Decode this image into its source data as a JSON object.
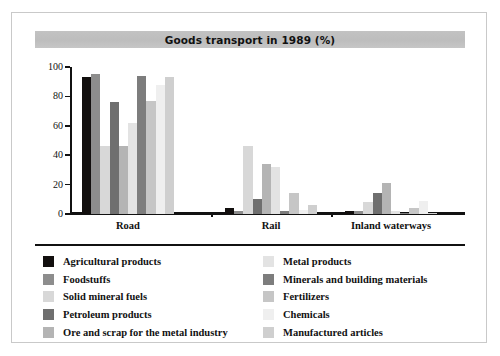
{
  "frame": {
    "present": true
  },
  "title": {
    "text": "Goods transport in 1989 (%)"
  },
  "legend": {
    "left_column": [
      {
        "label": "Agricultural products",
        "color": "#120f0e"
      },
      {
        "label": "Foodstuffs",
        "color": "#8d8d8d"
      },
      {
        "label": "Solid mineral fuels",
        "color": "#d8d8d8"
      },
      {
        "label": "Petroleum products",
        "color": "#6f6f6f"
      },
      {
        "label": "Ore and scrap for the metal industry",
        "color": "#b4b4b4"
      }
    ],
    "right_column": [
      {
        "label": "Metal products",
        "color": "#e3e3e3"
      },
      {
        "label": "Minerals and building materials",
        "color": "#7d7d7d"
      },
      {
        "label": "Fertilizers",
        "color": "#c6c6c6"
      },
      {
        "label": "Chemicals",
        "color": "#efefef"
      },
      {
        "label": "Manufactured articles",
        "color": "#cfcfcf"
      }
    ]
  },
  "chart_data": {
    "type": "bar",
    "title": "Goods transport in 1989 (%)",
    "xlabel": "",
    "ylabel": "",
    "ylim": [
      0,
      100
    ],
    "yticks": [
      0,
      20,
      40,
      60,
      80,
      100
    ],
    "grid": false,
    "legend_position": "bottom",
    "categories": [
      "Road",
      "Rail",
      "Inland waterways"
    ],
    "series": [
      {
        "name": "Agricultural products",
        "color": "#120f0e",
        "values": [
          93,
          4,
          2
        ]
      },
      {
        "name": "Foodstuffs",
        "color": "#8d8d8d",
        "values": [
          95,
          2,
          2
        ]
      },
      {
        "name": "Solid mineral fuels",
        "color": "#d8d8d8",
        "values": [
          46,
          46,
          8
        ]
      },
      {
        "name": "Petroleum products",
        "color": "#6f6f6f",
        "values": [
          76,
          10,
          14
        ]
      },
      {
        "name": "Ore and scrap for the metal industry",
        "color": "#b4b4b4",
        "values": [
          46,
          34,
          21
        ]
      },
      {
        "name": "Metal products",
        "color": "#e3e3e3",
        "values": [
          62,
          32,
          2
        ]
      },
      {
        "name": "Minerals and building materials",
        "color": "#7d7d7d",
        "values": [
          94,
          2,
          1
        ]
      },
      {
        "name": "Fertilizers",
        "color": "#c6c6c6",
        "values": [
          77,
          14,
          4
        ]
      },
      {
        "name": "Chemicals",
        "color": "#efefef",
        "values": [
          88,
          3,
          9
        ]
      },
      {
        "name": "Manufactured articles",
        "color": "#cfcfcf",
        "values": [
          93,
          6,
          1
        ]
      }
    ]
  }
}
